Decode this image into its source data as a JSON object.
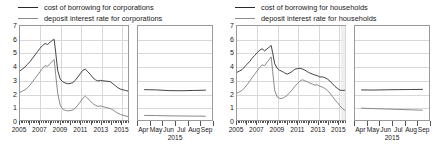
{
  "figure": {
    "panels": [
      {
        "id": "corporations",
        "legend": [
          {
            "label": "cost of borrowing for corporations",
            "color": "#2f2f2f"
          },
          {
            "label": "deposit interest rate for corporations",
            "color": "#7d7d7d"
          }
        ],
        "chart_data": {
          "type": "line",
          "title": "",
          "xlabel": "",
          "ylabel": "",
          "ylim": [
            0,
            7
          ],
          "yticks": [
            "0",
            "1",
            "2",
            "3",
            "4",
            "5",
            "6",
            "7"
          ],
          "grid": true,
          "legend_position": "top-left",
          "main": {
            "xlim": [
              2005.0,
              2015.75
            ],
            "xticks": [
              "2005",
              "2007",
              "2009",
              "2011",
              "2013",
              "2015"
            ],
            "xtick_values": [
              2005,
              2007,
              2009,
              2011,
              2013,
              2015
            ],
            "series": [
              {
                "name": "cost of borrowing for corporations",
                "color": "#2f2f2f",
                "x": [
                  2005.0,
                  2005.25,
                  2005.5,
                  2005.75,
                  2006.0,
                  2006.25,
                  2006.5,
                  2006.75,
                  2007.0,
                  2007.25,
                  2007.5,
                  2007.75,
                  2008.0,
                  2008.25,
                  2008.4,
                  2008.55,
                  2008.75,
                  2009.0,
                  2009.25,
                  2009.5,
                  2009.75,
                  2010.0,
                  2010.25,
                  2010.5,
                  2010.75,
                  2011.0,
                  2011.25,
                  2011.5,
                  2011.75,
                  2012.0,
                  2012.25,
                  2012.5,
                  2012.75,
                  2013.0,
                  2013.25,
                  2013.5,
                  2013.75,
                  2014.0,
                  2014.25,
                  2014.5,
                  2014.75,
                  2015.0,
                  2015.25,
                  2015.5,
                  2015.75
                ],
                "y": [
                  3.65,
                  3.8,
                  3.95,
                  4.15,
                  4.35,
                  4.6,
                  4.85,
                  5.1,
                  5.35,
                  5.55,
                  5.7,
                  5.62,
                  5.8,
                  5.95,
                  6.0,
                  5.05,
                  3.7,
                  3.05,
                  2.85,
                  2.75,
                  2.7,
                  2.72,
                  2.78,
                  2.95,
                  3.2,
                  3.45,
                  3.7,
                  3.78,
                  3.6,
                  3.4,
                  3.15,
                  3.0,
                  2.9,
                  2.95,
                  2.92,
                  2.9,
                  2.88,
                  2.85,
                  2.7,
                  2.55,
                  2.4,
                  2.3,
                  2.25,
                  2.2,
                  2.15
                ]
              },
              {
                "name": "deposit interest rate for corporations",
                "color": "#7d7d7d",
                "x": [
                  2005.0,
                  2005.25,
                  2005.5,
                  2005.75,
                  2006.0,
                  2006.25,
                  2006.5,
                  2006.75,
                  2007.0,
                  2007.25,
                  2007.5,
                  2007.75,
                  2008.0,
                  2008.25,
                  2008.4,
                  2008.55,
                  2008.75,
                  2009.0,
                  2009.25,
                  2009.5,
                  2009.75,
                  2010.0,
                  2010.25,
                  2010.5,
                  2010.75,
                  2011.0,
                  2011.25,
                  2011.5,
                  2011.75,
                  2012.0,
                  2012.25,
                  2012.5,
                  2012.75,
                  2013.0,
                  2013.25,
                  2013.5,
                  2013.75,
                  2014.0,
                  2014.25,
                  2014.5,
                  2014.75,
                  2015.0,
                  2015.25,
                  2015.5,
                  2015.75
                ],
                "y": [
                  2.05,
                  2.15,
                  2.25,
                  2.4,
                  2.6,
                  2.85,
                  3.1,
                  3.35,
                  3.6,
                  3.85,
                  4.05,
                  4.0,
                  4.2,
                  4.4,
                  4.5,
                  3.4,
                  2.0,
                  1.1,
                  0.82,
                  0.72,
                  0.68,
                  0.7,
                  0.75,
                  0.88,
                  1.1,
                  1.35,
                  1.62,
                  1.78,
                  1.6,
                  1.42,
                  1.22,
                  1.1,
                  1.02,
                  1.05,
                  1.0,
                  0.95,
                  0.9,
                  0.85,
                  0.75,
                  0.62,
                  0.5,
                  0.42,
                  0.35,
                  0.3,
                  0.25
                ]
              }
            ]
          },
          "inset": {
            "xlim": [
              0,
              6
            ],
            "xticks": [
              "Apr",
              "May",
              "Jun",
              "Jul",
              "Aug",
              "Sep"
            ],
            "year_label": "2015",
            "series": [
              {
                "name": "cost of borrowing for corporations",
                "color": "#2f2f2f",
                "x": [
                  0.5,
                  1.5,
                  2.5,
                  3.5,
                  4.5,
                  5.5
                ],
                "y": [
                  2.26,
                  2.24,
                  2.19,
                  2.18,
                  2.2,
                  2.22
                ]
              },
              {
                "name": "deposit interest rate for corporations",
                "color": "#7d7d7d",
                "x": [
                  0.5,
                  1.5,
                  2.5,
                  3.5,
                  4.5,
                  5.5
                ],
                "y": [
                  0.34,
                  0.33,
                  0.31,
                  0.3,
                  0.29,
                  0.28
                ]
              }
            ]
          }
        }
      },
      {
        "id": "households",
        "legend": [
          {
            "label": "cost of borrowing for households",
            "color": "#2f2f2f"
          },
          {
            "label": "deposit interest rate for households",
            "color": "#7d7d7d"
          }
        ],
        "chart_data": {
          "type": "line",
          "title": "",
          "xlabel": "",
          "ylabel": "",
          "ylim": [
            0,
            7
          ],
          "yticks": [
            "0",
            "1",
            "2",
            "3",
            "4",
            "5",
            "6",
            "7"
          ],
          "grid": true,
          "legend_position": "top-left",
          "highlight_band": {
            "from": 2015.2,
            "to": 2015.7,
            "color": "#e9e9e9"
          },
          "main": {
            "xlim": [
              2005.0,
              2015.75
            ],
            "xticks": [
              "2005",
              "2007",
              "2009",
              "2011",
              "2013",
              "2015"
            ],
            "xtick_values": [
              2005,
              2007,
              2009,
              2011,
              2013,
              2015
            ],
            "series": [
              {
                "name": "cost of borrowing for households",
                "color": "#2f2f2f",
                "x": [
                  2005.0,
                  2005.25,
                  2005.5,
                  2005.75,
                  2006.0,
                  2006.25,
                  2006.5,
                  2006.75,
                  2007.0,
                  2007.25,
                  2007.5,
                  2007.75,
                  2008.0,
                  2008.25,
                  2008.4,
                  2008.55,
                  2008.75,
                  2009.0,
                  2009.25,
                  2009.5,
                  2009.75,
                  2010.0,
                  2010.25,
                  2010.5,
                  2010.75,
                  2011.0,
                  2011.25,
                  2011.5,
                  2011.75,
                  2012.0,
                  2012.25,
                  2012.5,
                  2012.75,
                  2013.0,
                  2013.25,
                  2013.5,
                  2013.75,
                  2014.0,
                  2014.25,
                  2014.5,
                  2014.75,
                  2015.0,
                  2015.25,
                  2015.5,
                  2015.75
                ],
                "y": [
                  3.55,
                  3.65,
                  3.75,
                  3.95,
                  4.15,
                  4.35,
                  4.6,
                  4.8,
                  5.0,
                  5.2,
                  5.3,
                  5.15,
                  5.3,
                  5.45,
                  5.55,
                  5.0,
                  4.2,
                  3.85,
                  3.7,
                  3.62,
                  3.5,
                  3.42,
                  3.5,
                  3.62,
                  3.78,
                  3.82,
                  3.85,
                  3.8,
                  3.72,
                  3.6,
                  3.5,
                  3.42,
                  3.35,
                  3.3,
                  3.2,
                  3.22,
                  3.15,
                  3.05,
                  2.9,
                  2.7,
                  2.5,
                  2.35,
                  2.22,
                  2.2,
                  2.22
                ]
              },
              {
                "name": "deposit interest rate for households",
                "color": "#7d7d7d",
                "x": [
                  2005.0,
                  2005.25,
                  2005.5,
                  2005.75,
                  2006.0,
                  2006.25,
                  2006.5,
                  2006.75,
                  2007.0,
                  2007.25,
                  2007.5,
                  2007.75,
                  2008.0,
                  2008.25,
                  2008.4,
                  2008.55,
                  2008.75,
                  2009.0,
                  2009.25,
                  2009.5,
                  2009.75,
                  2010.0,
                  2010.25,
                  2010.5,
                  2010.75,
                  2011.0,
                  2011.25,
                  2011.5,
                  2011.75,
                  2012.0,
                  2012.25,
                  2012.5,
                  2012.75,
                  2013.0,
                  2013.25,
                  2013.5,
                  2013.75,
                  2014.0,
                  2014.25,
                  2014.5,
                  2014.75,
                  2015.0,
                  2015.25,
                  2015.5,
                  2015.75
                ],
                "y": [
                  2.0,
                  2.1,
                  2.2,
                  2.4,
                  2.62,
                  2.88,
                  3.15,
                  3.4,
                  3.65,
                  3.9,
                  4.1,
                  4.05,
                  4.3,
                  4.55,
                  4.7,
                  3.6,
                  2.2,
                  1.72,
                  1.6,
                  1.62,
                  1.7,
                  1.85,
                  2.05,
                  2.25,
                  2.5,
                  2.7,
                  2.88,
                  3.0,
                  2.92,
                  2.85,
                  2.75,
                  2.68,
                  2.6,
                  2.62,
                  2.5,
                  2.45,
                  2.35,
                  2.2,
                  2.0,
                  1.75,
                  1.5,
                  1.3,
                  1.05,
                  0.85,
                  0.7
                ]
              }
            ]
          },
          "inset": {
            "xlim": [
              0,
              6
            ],
            "xticks": [
              "Apr",
              "May",
              "Jun",
              "Jul",
              "Aug",
              "Sep"
            ],
            "year_label": "2015",
            "series": [
              {
                "name": "cost of borrowing for households",
                "color": "#2f2f2f",
                "x": [
                  0.5,
                  1.5,
                  2.5,
                  3.5,
                  4.5,
                  5.5
                ],
                "y": [
                  2.24,
                  2.23,
                  2.25,
                  2.26,
                  2.27,
                  2.28
                ]
              },
              {
                "name": "deposit interest rate for households",
                "color": "#7d7d7d",
                "x": [
                  0.5,
                  1.5,
                  2.5,
                  3.5,
                  4.5,
                  5.5
                ],
                "y": [
                  0.88,
                  0.85,
                  0.82,
                  0.79,
                  0.76,
                  0.73
                ]
              }
            ]
          }
        }
      }
    ]
  }
}
